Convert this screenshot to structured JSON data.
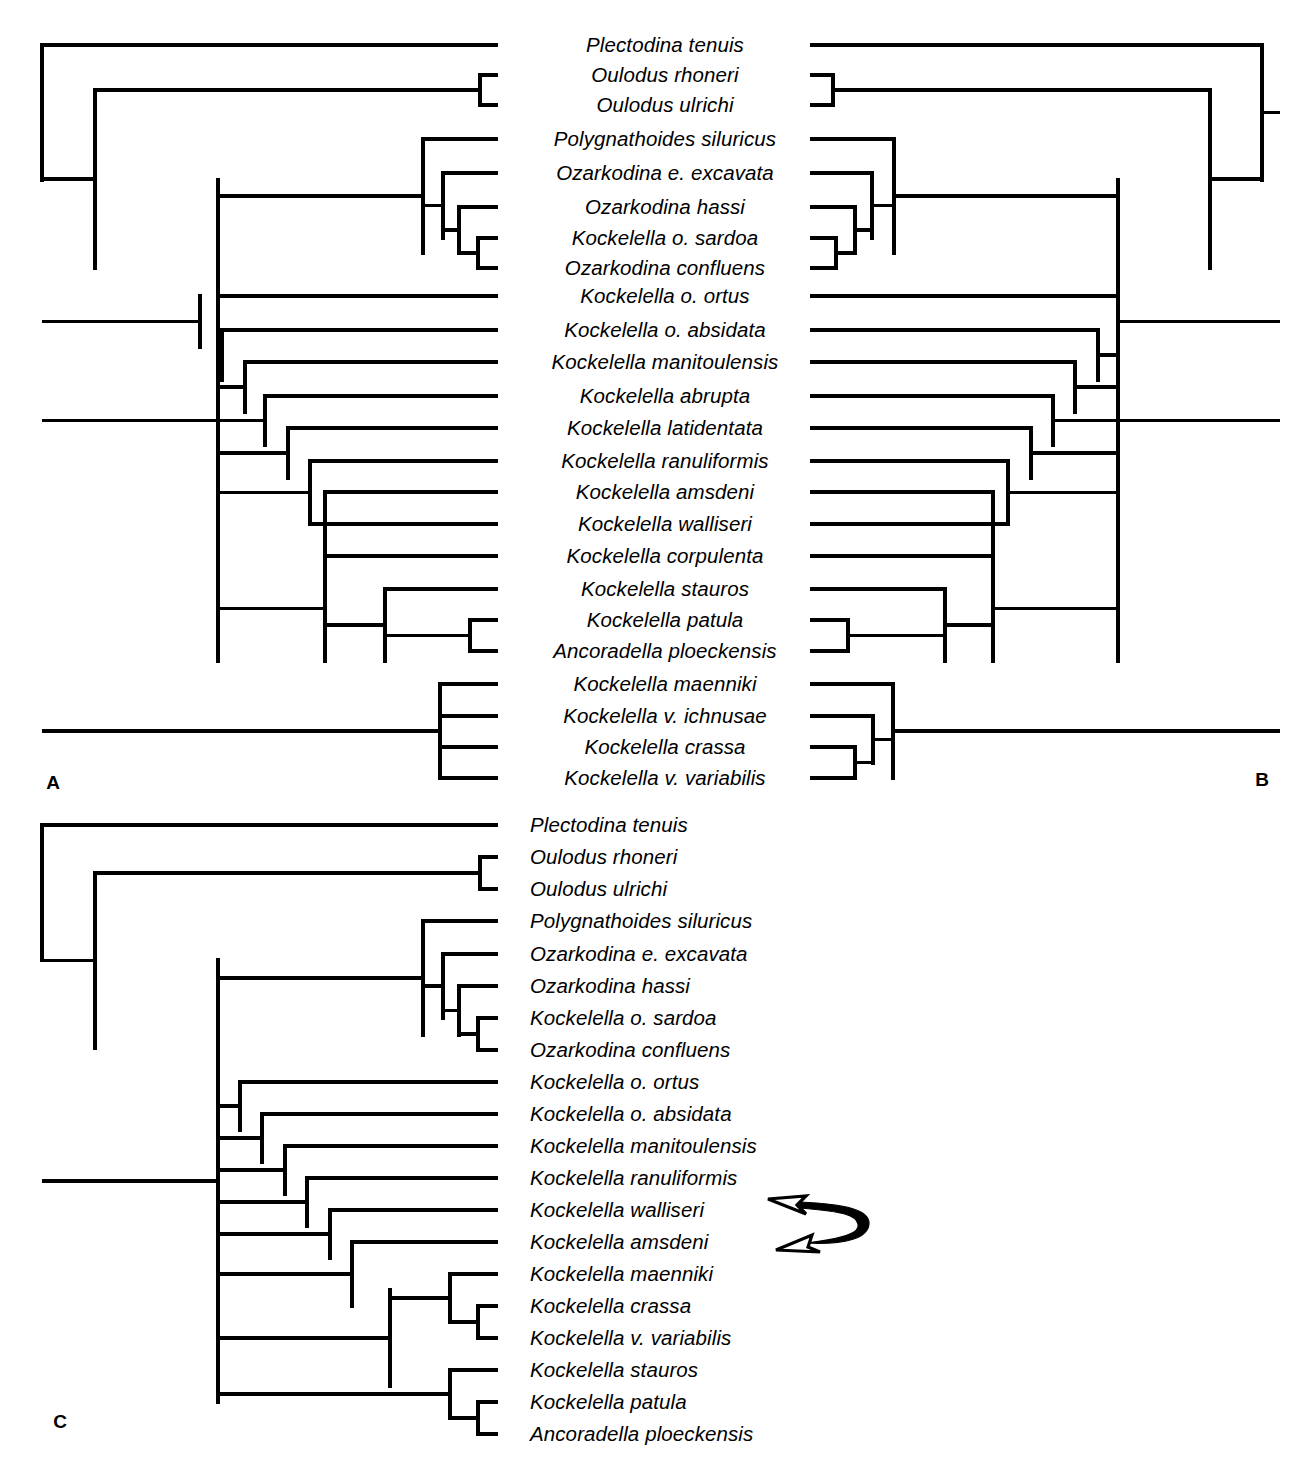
{
  "figure": {
    "type": "phylogenetic-cladogram-figure",
    "panels": [
      {
        "id": "A",
        "label": "A",
        "label_x": 53,
        "label_y": 783,
        "orientation": "left-rooted",
        "label_align": "centered",
        "label_anchor_x": 665,
        "tip_line_end_x": 498,
        "root_x": 42,
        "tips": [
          {
            "name": "Plectodina tenuis",
            "y": 45
          },
          {
            "name": "Oulodus rhoneri",
            "y": 75
          },
          {
            "name": "Oulodus ulrichi",
            "y": 105
          },
          {
            "name": "Polygnathoides siluricus",
            "y": 139
          },
          {
            "name": "Ozarkodina e. excavata",
            "y": 173
          },
          {
            "name": "Ozarkodina hassi",
            "y": 207
          },
          {
            "name": "Kockelella o. sardoa",
            "y": 238
          },
          {
            "name": "Ozarkodina confluens",
            "y": 268
          },
          {
            "name": "Kockelella o. ortus",
            "y": 296
          },
          {
            "name": "Kockelella o. absidata",
            "y": 330
          },
          {
            "name": "Kockelella manitoulensis",
            "y": 362
          },
          {
            "name": "Kockelella abrupta",
            "y": 396
          },
          {
            "name": "Kockelella latidentata",
            "y": 428
          },
          {
            "name": "Kockelella ranuliformis",
            "y": 461
          },
          {
            "name": "Kockelella amsdeni",
            "y": 492
          },
          {
            "name": "Kockelella walliseri",
            "y": 524
          },
          {
            "name": "Kockelella corpulenta",
            "y": 556
          },
          {
            "name": "Kockelella stauros",
            "y": 589
          },
          {
            "name": "Kockelella patula",
            "y": 620
          },
          {
            "name": "Ancoradella ploeckensis",
            "y": 651
          },
          {
            "name": "Kockelella maenniki",
            "y": 684
          },
          {
            "name": "Kockelella v. ichnusae",
            "y": 716
          },
          {
            "name": "Kockelella crassa",
            "y": 747
          },
          {
            "name": "Kockelella v. variabilis",
            "y": 778
          }
        ],
        "nodes": [
          {
            "x": 42,
            "y1": 45,
            "y2": 180
          },
          {
            "x": 95,
            "y1": 90,
            "y2": 268
          },
          {
            "x": 480,
            "y1": 75,
            "y2": 105
          },
          {
            "x": 218,
            "y1": 180,
            "y2": 661
          },
          {
            "x": 423,
            "y1": 139,
            "y2": 253
          },
          {
            "x": 443,
            "y1": 173,
            "y2": 238
          },
          {
            "x": 459,
            "y1": 207,
            "y2": 253
          },
          {
            "x": 478,
            "y1": 238,
            "y2": 268
          },
          {
            "x": 200,
            "y1": 296,
            "y2": 347
          },
          {
            "x": 222,
            "y1": 330,
            "y2": 380
          },
          {
            "x": 245,
            "y1": 362,
            "y2": 412
          },
          {
            "x": 265,
            "y1": 396,
            "y2": 445
          },
          {
            "x": 288,
            "y1": 428,
            "y2": 478
          },
          {
            "x": 310,
            "y1": 461,
            "y2": 524
          },
          {
            "x": 325,
            "y1": 492,
            "y2": 556
          },
          {
            "x": 325,
            "y1": 556,
            "y2": 661
          },
          {
            "x": 385,
            "y1": 589,
            "y2": 661
          },
          {
            "x": 470,
            "y1": 620,
            "y2": 651
          },
          {
            "x": 440,
            "y1": 684,
            "y2": 778
          }
        ]
      },
      {
        "id": "B",
        "label": "B",
        "label_x": 1262,
        "label_y": 780,
        "orientation": "right-rooted",
        "tip_line_start_x": 810,
        "root_x": 1280,
        "tips": [
          {
            "name": "Plectodina tenuis",
            "y": 45
          },
          {
            "name": "Oulodus rhoneri",
            "y": 75
          },
          {
            "name": "Oulodus ulrichi",
            "y": 105
          },
          {
            "name": "Polygnathoides siluricus",
            "y": 139
          },
          {
            "name": "Ozarkodina e. excavata",
            "y": 173
          },
          {
            "name": "Ozarkodina hassi",
            "y": 207
          },
          {
            "name": "Kockelella o. sardoa",
            "y": 238
          },
          {
            "name": "Ozarkodina confluens",
            "y": 268
          },
          {
            "name": "Kockelella o. ortus",
            "y": 296
          },
          {
            "name": "Kockelella o. absidata",
            "y": 330
          },
          {
            "name": "Kockelella manitoulensis",
            "y": 362
          },
          {
            "name": "Kockelella abrupta",
            "y": 396
          },
          {
            "name": "Kockelella latidentata",
            "y": 428
          },
          {
            "name": "Kockelella ranuliformis",
            "y": 461
          },
          {
            "name": "Kockelella amsdeni",
            "y": 492
          },
          {
            "name": "Kockelella walliseri",
            "y": 524
          },
          {
            "name": "Kockelella corpulenta",
            "y": 556
          },
          {
            "name": "Kockelella stauros",
            "y": 589
          },
          {
            "name": "Kockelella patula",
            "y": 620
          },
          {
            "name": "Ancoradella ploeckensis",
            "y": 651
          },
          {
            "name": "Kockelella maenniki",
            "y": 684
          },
          {
            "name": "Kockelella v. ichnusae",
            "y": 716
          },
          {
            "name": "Kockelella crassa",
            "y": 747
          },
          {
            "name": "Kockelella v. variabilis",
            "y": 778
          }
        ],
        "nodes": [
          {
            "x": 1262,
            "y1": 45,
            "y2": 180
          },
          {
            "x": 1210,
            "y1": 90,
            "y2": 268
          },
          {
            "x": 833,
            "y1": 75,
            "y2": 105
          },
          {
            "x": 1118,
            "y1": 180,
            "y2": 661
          },
          {
            "x": 894,
            "y1": 139,
            "y2": 253
          },
          {
            "x": 872,
            "y1": 173,
            "y2": 238
          },
          {
            "x": 855,
            "y1": 207,
            "y2": 253
          },
          {
            "x": 836,
            "y1": 238,
            "y2": 268
          },
          {
            "x": 1118,
            "y1": 296,
            "y2": 347
          },
          {
            "x": 1098,
            "y1": 330,
            "y2": 380
          },
          {
            "x": 1075,
            "y1": 362,
            "y2": 412
          },
          {
            "x": 1053,
            "y1": 396,
            "y2": 445
          },
          {
            "x": 1031,
            "y1": 428,
            "y2": 478
          },
          {
            "x": 1008,
            "y1": 461,
            "y2": 524
          },
          {
            "x": 993,
            "y1": 492,
            "y2": 556
          },
          {
            "x": 993,
            "y1": 556,
            "y2": 661
          },
          {
            "x": 945,
            "y1": 589,
            "y2": 661
          },
          {
            "x": 848,
            "y1": 620,
            "y2": 651
          },
          {
            "x": 893,
            "y1": 684,
            "y2": 778
          },
          {
            "x": 873,
            "y1": 716,
            "y2": 763
          },
          {
            "x": 855,
            "y1": 747,
            "y2": 778
          }
        ]
      },
      {
        "id": "C",
        "label": "C",
        "label_x": 60,
        "label_y": 1422,
        "orientation": "left-rooted",
        "label_align": "leftaligned",
        "label_anchor_x": 530,
        "tip_line_end_x": 498,
        "root_x": 42,
        "tips": [
          {
            "name": "Plectodina tenuis",
            "y": 825
          },
          {
            "name": "Oulodus rhoneri",
            "y": 857
          },
          {
            "name": "Oulodus ulrichi",
            "y": 889
          },
          {
            "name": "Polygnathoides siluricus",
            "y": 921
          },
          {
            "name": "Ozarkodina e. excavata",
            "y": 954
          },
          {
            "name": "Ozarkodina hassi",
            "y": 986
          },
          {
            "name": "Kockelella o. sardoa",
            "y": 1018
          },
          {
            "name": "Ozarkodina confluens",
            "y": 1050
          },
          {
            "name": "Kockelella o. ortus",
            "y": 1082
          },
          {
            "name": "Kockelella o. absidata",
            "y": 1114
          },
          {
            "name": "Kockelella manitoulensis",
            "y": 1146
          },
          {
            "name": "Kockelella ranuliformis",
            "y": 1178
          },
          {
            "name": "Kockelella walliseri",
            "y": 1210
          },
          {
            "name": "Kockelella amsdeni",
            "y": 1242
          },
          {
            "name": "Kockelella maenniki",
            "y": 1274
          },
          {
            "name": "Kockelella crassa",
            "y": 1306
          },
          {
            "name": "Kockelella v. variabilis",
            "y": 1338
          },
          {
            "name": "Kockelella stauros",
            "y": 1370
          },
          {
            "name": "Kockelella patula",
            "y": 1402
          },
          {
            "name": "Ancoradella ploeckensis",
            "y": 1434
          }
        ],
        "nodes": [
          {
            "x": 42,
            "y1": 825,
            "y2": 960
          },
          {
            "x": 95,
            "y1": 873,
            "y2": 1048
          },
          {
            "x": 480,
            "y1": 857,
            "y2": 889
          },
          {
            "x": 218,
            "y1": 960,
            "y2": 1402
          },
          {
            "x": 423,
            "y1": 921,
            "y2": 1035
          },
          {
            "x": 443,
            "y1": 954,
            "y2": 1018
          },
          {
            "x": 459,
            "y1": 986,
            "y2": 1035
          },
          {
            "x": 478,
            "y1": 1018,
            "y2": 1050
          },
          {
            "x": 240,
            "y1": 1082,
            "y2": 1130
          },
          {
            "x": 262,
            "y1": 1114,
            "y2": 1162
          },
          {
            "x": 285,
            "y1": 1146,
            "y2": 1194
          },
          {
            "x": 307,
            "y1": 1178,
            "y2": 1226
          },
          {
            "x": 330,
            "y1": 1210,
            "y2": 1258
          },
          {
            "x": 352,
            "y1": 1242,
            "y2": 1306
          },
          {
            "x": 390,
            "y1": 1290,
            "y2": 1386
          },
          {
            "x": 450,
            "y1": 1274,
            "y2": 1322
          },
          {
            "x": 478,
            "y1": 1306,
            "y2": 1338
          },
          {
            "x": 450,
            "y1": 1370,
            "y2": 1418
          },
          {
            "x": 478,
            "y1": 1402,
            "y2": 1434
          }
        ],
        "annotation": {
          "name": "taxon-swap-arrow",
          "description": "double-headed curved arrow between Kockelella walliseri and Kockelella amsdeni",
          "tip_top_x": 790,
          "tip_top_y": 1204,
          "tip_bottom_x": 800,
          "tip_bottom_y": 1240
        }
      }
    ]
  },
  "style": {
    "line_color": "#000000",
    "background": "#ffffff",
    "text_color": "#000000"
  }
}
